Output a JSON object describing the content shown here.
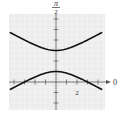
{
  "chart_data": {
    "type": "line",
    "title": "",
    "subtitle": "Polar graph of a hyperbola (conic with focus at pole)",
    "equation_implied": "r = 3/(1 + 2 sin θ)",
    "axes": {
      "polar_axis_label": "0",
      "vertical_axis_label_numerator": "π",
      "vertical_axis_label_denominator": "2",
      "tick_labels": [
        {
          "axis": "x",
          "value": 2,
          "text": "2"
        }
      ],
      "tick_spacing": 1,
      "xlim": [
        -4.5,
        4.5
      ],
      "ylim": [
        -2.7,
        6.5
      ],
      "grid": true
    },
    "series": [
      {
        "name": "upper-branch",
        "vertex": [
          0,
          3
        ],
        "points": [
          [
            -4.4,
            4.73
          ],
          [
            -3,
            4.0
          ],
          [
            -2,
            3.53
          ],
          [
            -1,
            3.15
          ],
          [
            0,
            3.0
          ],
          [
            1,
            3.15
          ],
          [
            2,
            3.53
          ],
          [
            3,
            4.0
          ],
          [
            4.4,
            4.73
          ]
        ]
      },
      {
        "name": "lower-branch",
        "vertex": [
          0,
          1
        ],
        "points": [
          [
            -4.4,
            -0.73
          ],
          [
            -3,
            0.0
          ],
          [
            -2,
            0.47
          ],
          [
            -1,
            0.85
          ],
          [
            0,
            1.0
          ],
          [
            1,
            0.85
          ],
          [
            2,
            0.47
          ],
          [
            3,
            0.0
          ],
          [
            4.4,
            -0.73
          ]
        ]
      }
    ],
    "center": [
      0,
      2
    ],
    "a": 1,
    "b": 1.732,
    "c": 2
  },
  "colors": {
    "grid_bg": "#ececec",
    "grid_line": "#f8f8f8",
    "axis": "#555555",
    "curve": "#111111",
    "text": "#333333"
  }
}
